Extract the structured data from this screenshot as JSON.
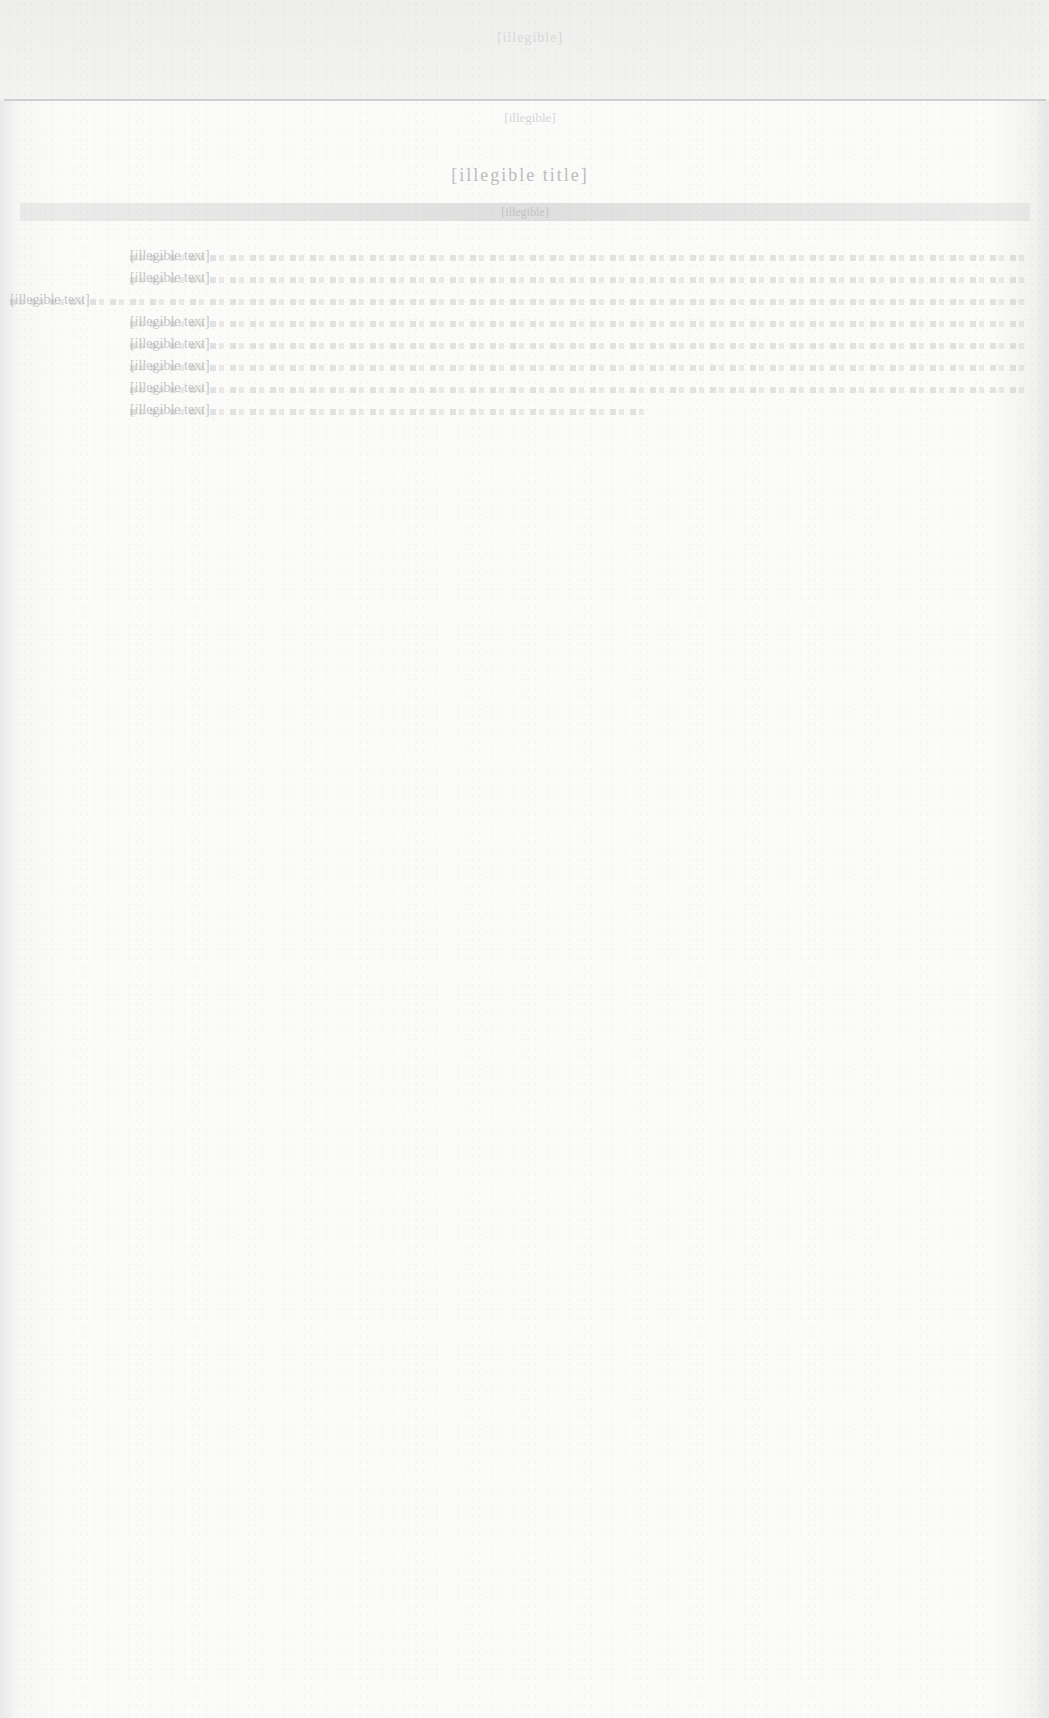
{
  "document": {
    "header": "[illegible]",
    "subheading": "[illegible]",
    "title": "[illegible title]",
    "banner": "[illegible]",
    "body_lines": [
      "[illegible text]",
      "[illegible text]",
      "[illegible text]",
      "[illegible text]",
      "[illegible text]",
      "[illegible text]",
      "[illegible text]",
      "[illegible text]"
    ],
    "closing_line": "[illegible]"
  }
}
